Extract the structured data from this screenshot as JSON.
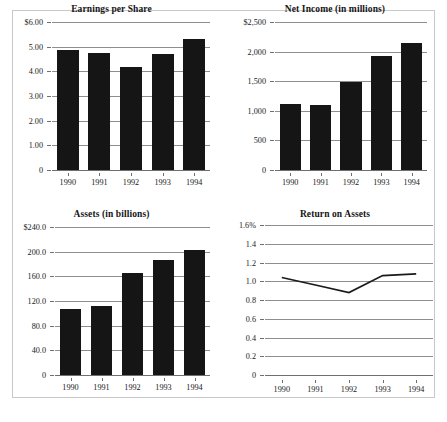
{
  "document": {
    "kind": "annual-report-financial-highlights",
    "panel_count": 4
  },
  "chart_data": [
    {
      "id": "earnings-per-share",
      "type": "bar",
      "title": "Earnings per Share",
      "xlabel": "",
      "ylabel": "",
      "grid": true,
      "legend": "none",
      "categories": [
        "1990",
        "1991",
        "1992",
        "1993",
        "1994"
      ],
      "values": [
        4.88,
        4.76,
        4.17,
        4.7,
        5.32
      ],
      "ylim": [
        0,
        6
      ],
      "yticks": [
        0,
        1,
        2,
        3,
        4,
        5,
        6
      ],
      "ytick_labels": [
        "0",
        "1.00",
        "2.00",
        "3.00",
        "4.00",
        "5.00",
        "$6.00"
      ],
      "bar_color": "#151515"
    },
    {
      "id": "net-income",
      "type": "bar",
      "title": "Net Income (in millions)",
      "xlabel": "",
      "ylabel": "",
      "grid": true,
      "legend": "none",
      "categories": [
        "1990",
        "1991",
        "1992",
        "1993",
        "1994"
      ],
      "values": [
        1110,
        1100,
        1490,
        1930,
        2140
      ],
      "ylim": [
        0,
        2500
      ],
      "yticks": [
        0,
        500,
        1000,
        1500,
        2000,
        2500
      ],
      "ytick_labels": [
        "0",
        "500",
        "1,000",
        "1,500",
        "2,000",
        "$2,500"
      ],
      "bar_color": "#151515"
    },
    {
      "id": "assets",
      "type": "bar",
      "title": "Assets (in billions)",
      "xlabel": "",
      "ylabel": "",
      "grid": true,
      "legend": "none",
      "categories": [
        "1990",
        "1991",
        "1992",
        "1993",
        "1994"
      ],
      "values": [
        107.0,
        112.0,
        165.0,
        187.0,
        203.0
      ],
      "ylim": [
        0,
        240
      ],
      "yticks": [
        0,
        40,
        80,
        120,
        160,
        200,
        240
      ],
      "ytick_labels": [
        "0",
        "40.0",
        "80.0",
        "120.0",
        "160.0",
        "200.0",
        "$240.0"
      ],
      "bar_color": "#151515"
    },
    {
      "id": "return-on-assets",
      "type": "line",
      "title": "Return on Assets",
      "xlabel": "",
      "ylabel": "",
      "grid": true,
      "legend": "none",
      "categories": [
        "1990",
        "1991",
        "1992",
        "1993",
        "1994"
      ],
      "values": [
        1.04,
        0.96,
        0.88,
        1.06,
        1.08
      ],
      "ylim": [
        0,
        1.6
      ],
      "yticks": [
        0,
        0.2,
        0.4,
        0.6,
        0.8,
        1.0,
        1.2,
        1.4,
        1.6
      ],
      "ytick_labels": [
        "0",
        "0.2",
        "0.4",
        "0.6",
        "0.8",
        "1.0",
        "1.2",
        "1.4",
        "1.6%"
      ],
      "line_color": "#1a1a1a"
    }
  ]
}
